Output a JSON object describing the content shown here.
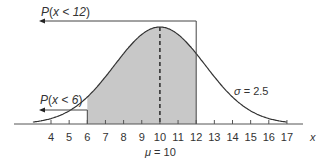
{
  "diagram": {
    "mean_label": "μ = 10",
    "mean_symbol": "μ",
    "mean_value": "10",
    "sd_label": "σ = 2.5",
    "sd_symbol": "σ",
    "sd_value": "2.5",
    "axis_label": "x",
    "tick_labels": [
      "4",
      "5",
      "6",
      "7",
      "8",
      "9",
      "10",
      "11",
      "12",
      "13",
      "14",
      "15",
      "16",
      "17"
    ],
    "annotations": [
      {
        "id": "p_less_12",
        "text": "P(x < 12)",
        "func": "P",
        "arg": "x < 12",
        "bound": 12
      },
      {
        "id": "p_less_6",
        "text": "P(x < 6)",
        "func": "P",
        "arg": "x < 6",
        "bound": 6
      }
    ],
    "shaded_region": {
      "from": 6,
      "to": 12
    },
    "colors": {
      "curve": "#333333",
      "shade": "#c8c8c8",
      "axis": "#555555",
      "text": "#333333"
    }
  }
}
